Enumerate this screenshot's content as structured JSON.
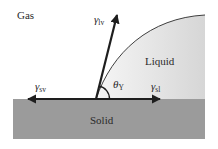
{
  "diagram": {
    "phases": {
      "gas": "Gas",
      "liquid": "Liquid",
      "solid": "Solid"
    },
    "vectors": {
      "liquid_vapor": {
        "symbol": "γ",
        "subscript": "lv"
      },
      "solid_vapor": {
        "symbol": "γ",
        "subscript": "sv"
      },
      "solid_liquid": {
        "symbol": "γ",
        "subscript": "sl"
      }
    },
    "angle": {
      "symbol": "θ",
      "subscript": "Y"
    },
    "colors": {
      "solid_fill": "#9b9b9b",
      "liquid_fill_light": "#f4f4f4",
      "liquid_fill_dark": "#d9d9d9",
      "arrow": "#1e1e1e",
      "text": "#2a2a2a"
    }
  }
}
